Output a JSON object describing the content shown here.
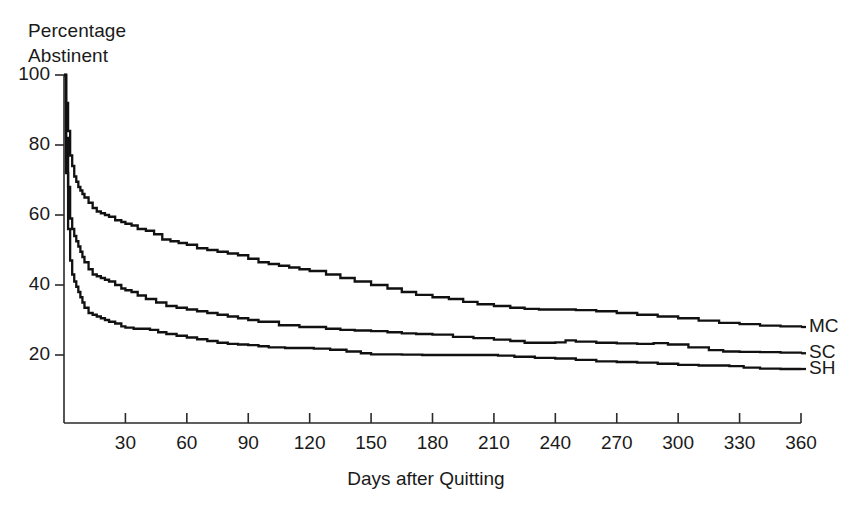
{
  "figure": {
    "y_axis_title_line1": "Percentage",
    "y_axis_title_line2": "Abstinent",
    "x_axis_title": "Days after Quitting",
    "caption_partial": ""
  },
  "chart_data": {
    "type": "line",
    "subtype": "step-survival",
    "title": "",
    "xlabel": "Days after Quitting",
    "ylabel": "Percentage Abstinent",
    "xlim": [
      0,
      360
    ],
    "ylim": [
      0,
      100
    ],
    "grid": false,
    "legend_position": "right-inline-labels",
    "xticks": [
      30,
      60,
      90,
      120,
      150,
      180,
      210,
      240,
      270,
      300,
      330,
      360
    ],
    "yticks": [
      20,
      40,
      60,
      80,
      100
    ],
    "line_color": "#111111",
    "series": [
      {
        "name": "MC",
        "label": "MC",
        "end_value": 28,
        "x": [
          0,
          1,
          2,
          3,
          4,
          5,
          6,
          7,
          8,
          9,
          10,
          12,
          14,
          16,
          18,
          20,
          22,
          25,
          28,
          30,
          33,
          36,
          40,
          44,
          48,
          52,
          56,
          60,
          65,
          70,
          75,
          80,
          85,
          90,
          95,
          100,
          105,
          110,
          115,
          120,
          128,
          135,
          142,
          150,
          158,
          165,
          172,
          180,
          188,
          195,
          202,
          210,
          218,
          225,
          232,
          240,
          250,
          260,
          270,
          280,
          290,
          300,
          310,
          320,
          330,
          340,
          350,
          360
        ],
        "y": [
          100,
          92,
          84,
          77,
          74,
          71,
          69.5,
          68,
          67,
          66,
          65,
          63.5,
          62,
          61,
          60.5,
          60,
          59.5,
          58.5,
          58,
          57.5,
          57,
          56,
          55.5,
          54.5,
          53,
          52.5,
          52,
          51.5,
          50.5,
          50,
          49.5,
          49,
          48.5,
          47.5,
          46.5,
          46,
          45.5,
          45,
          44.5,
          44,
          43,
          42,
          41,
          40,
          39,
          38,
          37.2,
          36.5,
          36,
          35.2,
          34.5,
          34,
          33.5,
          33.2,
          33,
          33,
          32.8,
          32.5,
          32,
          31.5,
          31,
          30.5,
          29.8,
          29.2,
          28.8,
          28.4,
          28.2,
          28
        ]
      },
      {
        "name": "SC",
        "label": "SC",
        "end_value": 20.5,
        "x": [
          0,
          1,
          2,
          3,
          4,
          5,
          6,
          7,
          8,
          9,
          10,
          12,
          14,
          16,
          18,
          20,
          22,
          25,
          28,
          30,
          33,
          36,
          40,
          45,
          50,
          55,
          60,
          65,
          70,
          75,
          80,
          85,
          90,
          95,
          100,
          105,
          110,
          115,
          120,
          128,
          135,
          142,
          150,
          158,
          165,
          172,
          180,
          190,
          200,
          210,
          218,
          225,
          232,
          240,
          245,
          250,
          260,
          270,
          280,
          288,
          295,
          305,
          315,
          322,
          330,
          340,
          350,
          360
        ],
        "y": [
          100,
          82,
          68,
          59,
          56,
          54,
          52.5,
          51,
          49.5,
          48,
          46.5,
          44.5,
          43,
          42.5,
          42,
          41.5,
          41,
          40,
          39,
          38.5,
          38,
          37,
          36,
          35,
          34,
          33.5,
          33,
          32.5,
          32,
          31.5,
          31,
          30.5,
          30,
          29.5,
          29.5,
          28.5,
          28.5,
          28,
          28,
          27.5,
          27.2,
          27,
          26.8,
          26.5,
          26.2,
          26,
          25.8,
          25.2,
          24.8,
          24.4,
          24,
          23.5,
          23.5,
          23.6,
          24.2,
          23.8,
          23.5,
          23.3,
          23.2,
          23.4,
          23,
          22.2,
          21.4,
          21,
          20.9,
          20.8,
          20.7,
          20.5
        ]
      },
      {
        "name": "SH",
        "label": "SH",
        "end_value": 16,
        "x": [
          0,
          1,
          2,
          3,
          4,
          5,
          6,
          7,
          8,
          9,
          10,
          12,
          14,
          16,
          18,
          20,
          22,
          25,
          28,
          30,
          34,
          38,
          42,
          46,
          50,
          55,
          60,
          65,
          70,
          75,
          80,
          85,
          90,
          95,
          100,
          108,
          115,
          122,
          130,
          138,
          145,
          150,
          158,
          165,
          175,
          185,
          195,
          205,
          212,
          220,
          230,
          240,
          250,
          260,
          270,
          280,
          290,
          300,
          310,
          318,
          325,
          332,
          340,
          350,
          360
        ],
        "y": [
          100,
          72,
          56,
          47,
          43,
          41,
          39.5,
          38,
          36.5,
          35,
          33.5,
          32,
          31.5,
          31,
          30.5,
          30,
          29.5,
          29,
          28.2,
          27.8,
          27.5,
          27.5,
          27.2,
          26.5,
          26,
          25.5,
          25,
          24.5,
          24,
          23.5,
          23.2,
          23,
          22.8,
          22.5,
          22.2,
          22,
          22,
          21.8,
          21.5,
          21,
          20.5,
          20.2,
          20.2,
          20.1,
          20,
          20,
          20,
          20,
          19.8,
          19.5,
          19.2,
          19,
          18.6,
          18.2,
          18,
          17.8,
          17.5,
          17.2,
          17,
          17,
          16.8,
          16.4,
          16.1,
          16,
          16
        ]
      }
    ]
  }
}
